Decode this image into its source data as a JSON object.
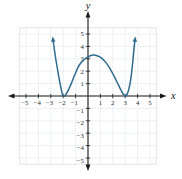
{
  "figure": {
    "width": 182,
    "height": 179,
    "background": "#ffffff"
  },
  "colors": {
    "axis": "#1b1b1b",
    "grid": "#c9d7e4",
    "tick_label": "#2b2b2b",
    "curve": "#2f6b8f"
  },
  "chart_data": {
    "type": "line",
    "title": "",
    "xlabel": "x",
    "ylabel": "y",
    "x_range": [
      -5.5,
      5.5
    ],
    "y_range": [
      -5.5,
      5.5
    ],
    "x_ticks": [
      -5,
      -4,
      -3,
      -2,
      -1,
      1,
      2,
      3,
      4,
      5
    ],
    "y_ticks": [
      -5,
      -4,
      -3,
      -2,
      -1,
      1,
      2,
      3,
      4,
      5
    ],
    "grid": true,
    "axis_arrows": true,
    "features": {
      "x_intercepts": [
        -2,
        3
      ],
      "local_minima": [
        [
          -2,
          0
        ],
        [
          3,
          0
        ]
      ],
      "local_max": [
        0.4,
        3.3
      ],
      "y_intercept": 3.15
    },
    "series": [
      {
        "name": "polynomial-curve",
        "color": "#2f6b8f",
        "arrow_ends": true,
        "points": [
          [
            -2.82,
            4.55
          ],
          [
            -2.74,
            3.95
          ],
          [
            -2.64,
            3.25
          ],
          [
            -2.52,
            2.5
          ],
          [
            -2.4,
            1.8
          ],
          [
            -2.28,
            1.15
          ],
          [
            -2.17,
            0.6
          ],
          [
            -2.08,
            0.2
          ],
          [
            -2.0,
            0.03
          ],
          [
            -1.9,
            0.0
          ],
          [
            -1.78,
            0.12
          ],
          [
            -1.6,
            0.45
          ],
          [
            -1.35,
            1.0
          ],
          [
            -1.05,
            1.75
          ],
          [
            -0.7,
            2.5
          ],
          [
            -0.35,
            2.9
          ],
          [
            0.0,
            3.15
          ],
          [
            0.4,
            3.3
          ],
          [
            0.8,
            3.22
          ],
          [
            1.1,
            3.05
          ],
          [
            1.4,
            2.75
          ],
          [
            1.75,
            2.25
          ],
          [
            2.1,
            1.6
          ],
          [
            2.45,
            0.9
          ],
          [
            2.7,
            0.4
          ],
          [
            2.88,
            0.1
          ],
          [
            3.0,
            0.0
          ],
          [
            3.12,
            0.08
          ],
          [
            3.25,
            0.4
          ],
          [
            3.38,
            0.95
          ],
          [
            3.5,
            1.75
          ],
          [
            3.6,
            2.65
          ],
          [
            3.68,
            3.5
          ],
          [
            3.74,
            4.1
          ],
          [
            3.79,
            4.55
          ]
        ]
      }
    ]
  }
}
